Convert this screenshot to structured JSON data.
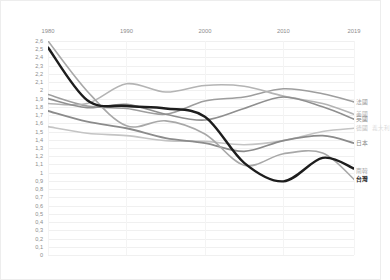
{
  "chart_data": {
    "type": "line",
    "title": "",
    "subtitle": "",
    "xlabel": "",
    "ylabel": "",
    "xaxis_position": "top",
    "grid": true,
    "legend_position": "right-inline",
    "decimal_separator": ",",
    "x": [
      1980,
      1990,
      2000,
      2010,
      2019
    ],
    "x_ticklabels": [
      "1980",
      "1990",
      "2000",
      "2010",
      "2019"
    ],
    "xlim": [
      1980,
      2019
    ],
    "ylim": [
      0,
      2.6
    ],
    "y_ticklabels": [
      "2,6",
      "2,5",
      "2,4",
      "2,3",
      "2,2",
      "2,1",
      "2",
      "1,9",
      "1,8",
      "1,7",
      "1,6",
      "1,5",
      "1,4",
      "1,3",
      "1,2",
      "1,1",
      "1",
      "0,9",
      "0,8",
      "0,7",
      "0,6",
      "0,5",
      "0,4",
      "0,3",
      "0,2",
      "0,1",
      "0"
    ],
    "y_tickvalues": [
      2.6,
      2.5,
      2.4,
      2.3,
      2.2,
      2.1,
      2.0,
      1.9,
      1.8,
      1.7,
      1.6,
      1.5,
      1.4,
      1.3,
      1.2,
      1.1,
      1.0,
      0.9,
      0.8,
      0.7,
      0.6,
      0.5,
      0.4,
      0.3,
      0.2,
      0.1,
      0.0
    ],
    "series": [
      {
        "name": "法國",
        "label": "法國",
        "color": "#9e9e9e",
        "width": 1.6,
        "x": [
          1980,
          1985,
          1990,
          1995,
          2000,
          2005,
          2010,
          2015,
          2019
        ],
        "values": [
          1.95,
          1.81,
          1.78,
          1.71,
          1.87,
          1.92,
          2.02,
          1.96,
          1.86
        ]
      },
      {
        "name": "美國",
        "label": "美國",
        "color": "#b4b4b4",
        "width": 1.6,
        "x": [
          1980,
          1985,
          1990,
          1995,
          2000,
          2005,
          2010,
          2015,
          2019
        ],
        "values": [
          1.84,
          1.84,
          2.08,
          1.98,
          2.06,
          2.05,
          1.93,
          1.84,
          1.71
        ]
      },
      {
        "name": "英國",
        "label": "英國",
        "color": "#8f8f8f",
        "width": 1.6,
        "x": [
          1980,
          1985,
          1990,
          1995,
          2000,
          2005,
          2010,
          2015,
          2019
        ],
        "values": [
          1.9,
          1.79,
          1.83,
          1.71,
          1.64,
          1.78,
          1.92,
          1.8,
          1.65
        ]
      },
      {
        "name": "德國",
        "label": "德國",
        "color": "#c4c4c4",
        "width": 1.6,
        "x": [
          1980,
          1985,
          1990,
          1995,
          2000,
          2005,
          2010,
          2015,
          2019
        ],
        "values": [
          1.56,
          1.48,
          1.45,
          1.39,
          1.38,
          1.34,
          1.39,
          1.5,
          1.54
        ]
      },
      {
        "name": "日本",
        "label": "日本",
        "color": "#8b8b8b",
        "width": 1.8,
        "x": [
          1980,
          1985,
          1990,
          1995,
          2000,
          2005,
          2010,
          2015,
          2019
        ],
        "values": [
          1.75,
          1.62,
          1.54,
          1.42,
          1.36,
          1.26,
          1.39,
          1.45,
          1.36
        ]
      },
      {
        "name": "南韓",
        "label": "南韓",
        "color": "#a8a8a8",
        "width": 1.6,
        "x": [
          1980,
          1985,
          1990,
          1995,
          2000,
          2005,
          2010,
          2015,
          2019
        ],
        "values": [
          2.82,
          1.99,
          1.57,
          1.63,
          1.47,
          1.09,
          1.23,
          1.24,
          0.92
        ]
      },
      {
        "name": "台灣",
        "label": "台灣",
        "color": "#1d1d1d",
        "width": 2.4,
        "highlight": true,
        "x": [
          1980,
          1985,
          1990,
          1995,
          2000,
          2005,
          2010,
          2015,
          2019
        ],
        "values": [
          2.52,
          1.88,
          1.81,
          1.78,
          1.68,
          1.12,
          0.895,
          1.18,
          1.05
        ]
      }
    ],
    "legend_entries": [
      {
        "label": "法國",
        "color": "#9e9e9e",
        "y_value": 1.86
      },
      {
        "label": "美國",
        "color": "#b4b4b4",
        "y_value": 1.71
      },
      {
        "label": "英國",
        "color": "#8f8f8f",
        "y_value": 1.65
      },
      {
        "label": "德國",
        "color": "#c4c4c4",
        "y_value": 1.54
      },
      {
        "label": "日本",
        "color": "#8b8b8b",
        "y_value": 1.36
      },
      {
        "label": "南韓",
        "color": "#a8a8a8",
        "y_value": 1.02
      },
      {
        "label": "台灣",
        "color": "#1d1d1d",
        "y_value": 0.92,
        "bold": true
      }
    ],
    "legend_extra_label": "義大利"
  }
}
